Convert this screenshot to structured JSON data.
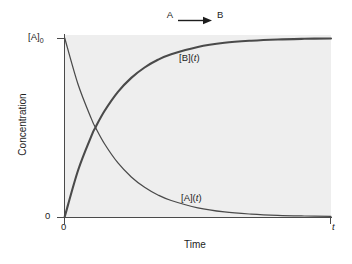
{
  "reaction": {
    "reactant": "A",
    "product": "B",
    "arrow_icon": "right-arrow-icon"
  },
  "chart_data": {
    "type": "line",
    "title": "",
    "xlabel": "Time",
    "ylabel": "Concentration",
    "grid": false,
    "legend_position": "inline-annotation",
    "background_color": "#eeeeee",
    "curve_color": "#4a4a4a",
    "x_ticks": [
      "0",
      "t"
    ],
    "y_ticks": [
      "0",
      "[A]0"
    ],
    "y_tick_labels": [
      "0",
      "[A]₀"
    ],
    "xlim": [
      0,
      1
    ],
    "ylim": [
      0,
      1
    ],
    "rate_constant_k": 6,
    "crossing_point": {
      "x": 0.1155,
      "y": 0.5
    },
    "series": [
      {
        "name": "[A](t)",
        "label": "[A](t)",
        "label_text_a": "[A](",
        "label_text_t": "t",
        "label_text_close": ")",
        "equation": "[A](t) = [A]0 * exp(-kt)",
        "x": [
          0,
          0.05,
          0.1,
          0.1155,
          0.15,
          0.2,
          0.25,
          0.3,
          0.35,
          0.4,
          0.5,
          0.6,
          0.7,
          0.8,
          0.9,
          1.0
        ],
        "y": [
          1.0,
          0.741,
          0.549,
          0.5,
          0.407,
          0.301,
          0.223,
          0.165,
          0.122,
          0.091,
          0.05,
          0.027,
          0.015,
          0.008,
          0.0045,
          0.0025
        ]
      },
      {
        "name": "[B](t)",
        "label": "[B](t)",
        "label_text_b": "[B](",
        "label_text_t": "t",
        "label_text_close": ")",
        "equation": "[B](t) = [A]0 * (1 - exp(-kt))",
        "x": [
          0,
          0.05,
          0.1,
          0.1155,
          0.15,
          0.2,
          0.25,
          0.3,
          0.35,
          0.4,
          0.5,
          0.6,
          0.7,
          0.8,
          0.9,
          1.0
        ],
        "y": [
          0.0,
          0.259,
          0.451,
          0.5,
          0.593,
          0.699,
          0.777,
          0.835,
          0.878,
          0.909,
          0.95,
          0.973,
          0.985,
          0.992,
          0.9955,
          0.9975
        ]
      }
    ]
  }
}
